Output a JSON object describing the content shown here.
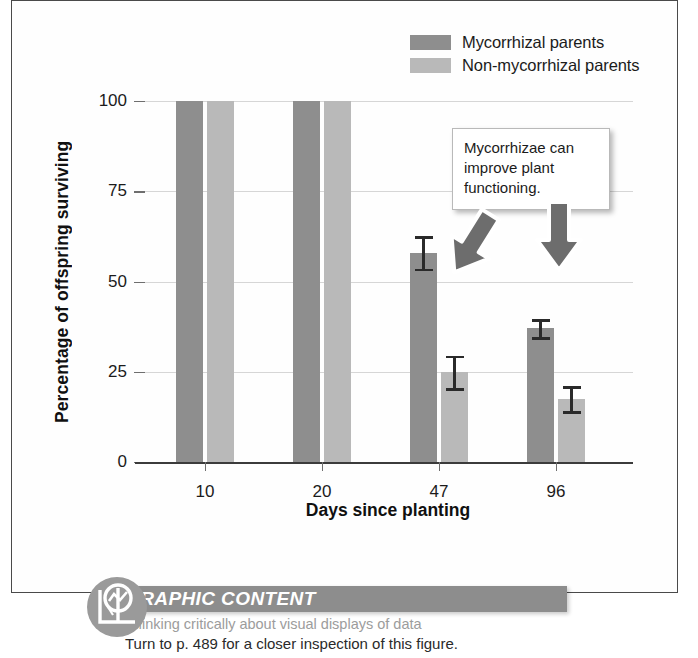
{
  "chart_data": {
    "type": "bar",
    "title": "",
    "xlabel": "Days since planting",
    "ylabel": "Percentage of offspring surviving",
    "categories": [
      "10",
      "20",
      "47",
      "96"
    ],
    "ylim": [
      0,
      100
    ],
    "yticks": [
      "0",
      "25",
      "50",
      "75",
      "100"
    ],
    "grid": true,
    "legend_position": "top-right",
    "series": [
      {
        "name": "Mycorrhizal parents",
        "color": "#8e8e8e",
        "values": [
          100,
          100,
          58,
          37
        ],
        "errors": [
          0,
          0,
          4.5,
          2.5
        ]
      },
      {
        "name": "Non-mycorrhizal parents",
        "color": "#b9b9b9",
        "values": [
          100,
          100,
          25,
          17.5
        ],
        "errors": [
          0,
          0,
          4.5,
          3.5
        ]
      }
    ],
    "annotations": [
      {
        "text": "Mycorrhizae can improve plant functioning.",
        "arrows": [
          "down-left",
          "down"
        ]
      }
    ]
  },
  "legend": {
    "items": [
      {
        "label": "Mycorrhizal parents",
        "color": "#8e8e8e"
      },
      {
        "label": "Non-mycorrhizal parents",
        "color": "#b9b9b9"
      }
    ]
  },
  "axes": {
    "y_title": "Percentage of offspring surviving",
    "x_title": "Days since planting",
    "y_ticks": [
      "100",
      "75",
      "50",
      "25",
      "0"
    ],
    "x_ticks": [
      "10",
      "20",
      "47",
      "96"
    ]
  },
  "callout": {
    "line1": "Mycorrhizae can",
    "line2": "improve plant",
    "line3": "functioning."
  },
  "footer": {
    "title": "GRAPHIC CONTENT",
    "subtitle": "Thinking critically about visual displays of data",
    "reference": "Turn to p. 489 for a closer inspection of this figure.",
    "icon": "magnifier-chart-icon",
    "accent_color": "#8d8d8d"
  }
}
